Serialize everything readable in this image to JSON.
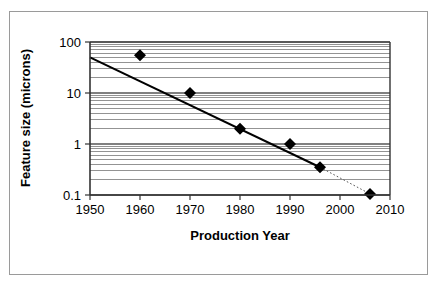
{
  "figure": {
    "frame_color": "#9a9a9a",
    "background": "#ffffff"
  },
  "chart_data": {
    "type": "scatter",
    "title": "",
    "subtitle": "",
    "xlabel": "Production Year",
    "ylabel": "Feature size (microns)",
    "xscale": "linear",
    "yscale": "log",
    "xlim": [
      1950,
      2010
    ],
    "ylim": [
      0.1,
      100
    ],
    "grid": true,
    "grid_minor": true,
    "grid_color": "#808080",
    "legend": null,
    "legend_position": "none",
    "x_ticks": [
      1950,
      1960,
      1970,
      1980,
      1990,
      2000,
      2010
    ],
    "x_tick_labels": [
      "1950",
      "1960",
      "1970",
      "1980",
      "1990",
      "2000",
      "2010"
    ],
    "y_ticks": [
      0.1,
      1,
      10,
      100
    ],
    "y_tick_labels": [
      "0.1",
      "1",
      "10",
      "100"
    ],
    "marker": "diamond",
    "marker_color": "#000000",
    "marker_size": 9,
    "x": [
      1960,
      1970,
      1980,
      1990,
      1996,
      2006
    ],
    "y": [
      55,
      10,
      2.0,
      1.0,
      0.35,
      0.105
    ],
    "points": [
      {
        "x": 1960,
        "y": 55
      },
      {
        "x": 1970,
        "y": 10
      },
      {
        "x": 1980,
        "y": 2.0
      },
      {
        "x": 1990,
        "y": 1.0
      },
      {
        "x": 1996,
        "y": 0.35
      },
      {
        "x": 2006,
        "y": 0.105
      }
    ],
    "series": [
      {
        "name": "Feature size",
        "style": "markers",
        "values": [
          55,
          10,
          2.0,
          1.0,
          0.35,
          0.105
        ]
      },
      {
        "name": "Trend line (solid)",
        "style": "solid-line",
        "color": "#000000",
        "x": [
          1950,
          1996
        ],
        "y": [
          50,
          0.35
        ]
      },
      {
        "name": "Trend extrapolation (dotted)",
        "style": "dotted-line",
        "color": "#555555",
        "x": [
          1996,
          2006
        ],
        "y": [
          0.35,
          0.105
        ]
      }
    ],
    "annotations": []
  }
}
